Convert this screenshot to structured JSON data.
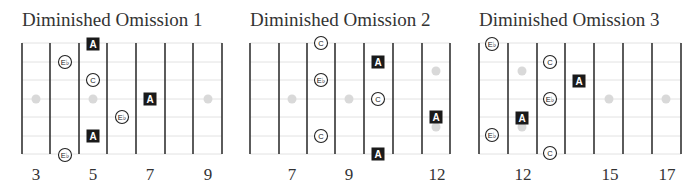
{
  "colors": {
    "fret_line": "#333333",
    "string_line": "#e2e2e2",
    "inlay_dot": "#d9d9d9",
    "root_box": "#1a1a1a",
    "root_text": "#ffffff",
    "circle_stroke": "#222222",
    "text": "#333333"
  },
  "layout": {
    "string_y": [
      43,
      62,
      80,
      99,
      117,
      136,
      154
    ],
    "fret_top": 43,
    "fret_bottom": 154,
    "fret_spacing": 28.6,
    "number_baseline_y": 180
  },
  "diagrams": [
    {
      "title": "Diminished Omission 1",
      "origin_x": 22,
      "fret_x": [
        22,
        50,
        79,
        107,
        136,
        165,
        193,
        222
      ],
      "fret_numbers": [
        {
          "label": "3",
          "x": 36
        },
        {
          "label": "5",
          "x": 93
        },
        {
          "label": "7",
          "x": 150
        },
        {
          "label": "9",
          "x": 208
        }
      ],
      "inlay_dots": [
        {
          "x": 36,
          "y": 99
        },
        {
          "x": 93,
          "y": 99
        },
        {
          "x": 208,
          "y": 99
        }
      ],
      "notes": [
        {
          "type": "root",
          "label": "A",
          "x": 93,
          "y": 44
        },
        {
          "type": "circle",
          "label": "E♭",
          "x": 65,
          "y": 62
        },
        {
          "type": "circle",
          "label": "C",
          "x": 93,
          "y": 80
        },
        {
          "type": "root",
          "label": "A",
          "x": 150,
          "y": 99
        },
        {
          "type": "circle",
          "label": "E♭",
          "x": 122,
          "y": 117
        },
        {
          "type": "root",
          "label": "A",
          "x": 93,
          "y": 136
        },
        {
          "type": "circle",
          "label": "E♭",
          "x": 65,
          "y": 155
        }
      ]
    },
    {
      "title": "Diminished Omission 2",
      "origin_x": 250,
      "fret_x": [
        250,
        279,
        307,
        335,
        364,
        393,
        422,
        450
      ],
      "fret_numbers": [
        {
          "label": "7",
          "x": 292
        },
        {
          "label": "9",
          "x": 349
        },
        {
          "label": "12",
          "x": 437
        }
      ],
      "inlay_dots": [
        {
          "x": 292,
          "y": 99
        },
        {
          "x": 349,
          "y": 99
        },
        {
          "x": 436,
          "y": 71
        },
        {
          "x": 436,
          "y": 127
        }
      ],
      "notes": [
        {
          "type": "circle",
          "label": "C",
          "x": 321,
          "y": 43
        },
        {
          "type": "root",
          "label": "A",
          "x": 378,
          "y": 62
        },
        {
          "type": "circle",
          "label": "E♭",
          "x": 321,
          "y": 80
        },
        {
          "type": "circle",
          "label": "C",
          "x": 378,
          "y": 99
        },
        {
          "type": "root",
          "label": "A",
          "x": 436,
          "y": 117
        },
        {
          "type": "circle",
          "label": "C",
          "x": 321,
          "y": 136
        },
        {
          "type": "root",
          "label": "A",
          "x": 378,
          "y": 154
        }
      ]
    },
    {
      "title": "Diminished Omission 3",
      "origin_x": 479,
      "fret_x": [
        479,
        508,
        537,
        565,
        594,
        623,
        652,
        681
      ],
      "fret_numbers": [
        {
          "label": "12",
          "x": 523
        },
        {
          "label": "15",
          "x": 610
        },
        {
          "label": "17",
          "x": 667
        }
      ],
      "inlay_dots": [
        {
          "x": 522,
          "y": 71
        },
        {
          "x": 522,
          "y": 127
        },
        {
          "x": 609,
          "y": 99
        },
        {
          "x": 666,
          "y": 99
        }
      ],
      "notes": [
        {
          "type": "circle",
          "label": "E♭",
          "x": 492,
          "y": 44
        },
        {
          "type": "circle",
          "label": "C",
          "x": 550,
          "y": 62
        },
        {
          "type": "root",
          "label": "A",
          "x": 579,
          "y": 81
        },
        {
          "type": "circle",
          "label": "E♭",
          "x": 550,
          "y": 99
        },
        {
          "type": "root",
          "label": "A",
          "x": 522,
          "y": 118
        },
        {
          "type": "circle",
          "label": "E♭",
          "x": 492,
          "y": 135
        },
        {
          "type": "circle",
          "label": "C",
          "x": 550,
          "y": 153
        }
      ]
    }
  ]
}
